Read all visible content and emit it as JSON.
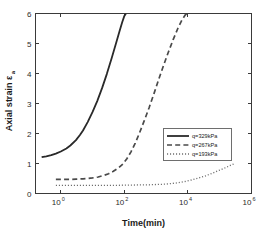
{
  "chart_data": {
    "type": "line",
    "title": "",
    "xlabel": "Time(min)",
    "ylabel": "Axial strain",
    "ylabel_sub": "a",
    "ylabel_symbol": "ε",
    "xscale": "log",
    "yscale": "linear",
    "xlim": [
      0.16,
      1000000
    ],
    "ylim": [
      0,
      6
    ],
    "grid": false,
    "legend_position": "center-right",
    "xticks": [
      {
        "value": 1,
        "label": "10",
        "exponent": "0"
      },
      {
        "value": 100,
        "label": "10",
        "exponent": "2"
      },
      {
        "value": 10000,
        "label": "10",
        "exponent": "4"
      },
      {
        "value": 1000000,
        "label": "10",
        "exponent": "6"
      }
    ],
    "yticks": [
      {
        "value": 0,
        "label": "0"
      },
      {
        "value": 1,
        "label": "1"
      },
      {
        "value": 2,
        "label": "2"
      },
      {
        "value": 3,
        "label": "3"
      },
      {
        "value": 4,
        "label": "4"
      },
      {
        "value": 5,
        "label": "5"
      },
      {
        "value": 6,
        "label": "6"
      }
    ],
    "series": [
      {
        "name": "q=329kPa",
        "style": "solid",
        "color": "#2a2a2a",
        "width": 1.8,
        "points": [
          [
            0.25,
            1.21
          ],
          [
            0.35,
            1.24
          ],
          [
            0.5,
            1.28
          ],
          [
            0.7,
            1.33
          ],
          [
            1.0,
            1.4
          ],
          [
            1.5,
            1.5
          ],
          [
            2.0,
            1.6
          ],
          [
            3.0,
            1.78
          ],
          [
            4.0,
            1.95
          ],
          [
            5.0,
            2.1
          ],
          [
            7.0,
            2.38
          ],
          [
            10.0,
            2.72
          ],
          [
            14.0,
            3.08
          ],
          [
            20.0,
            3.52
          ],
          [
            28.0,
            3.98
          ],
          [
            40.0,
            4.52
          ],
          [
            55.0,
            5.02
          ],
          [
            70.0,
            5.4
          ],
          [
            85.0,
            5.7
          ],
          [
            100.0,
            5.92
          ],
          [
            112.0,
            6.0
          ]
        ]
      },
      {
        "name": "q=267kPa",
        "style": "dashed",
        "color": "#4a4a4a",
        "width": 1.7,
        "points": [
          [
            0.7,
            0.47
          ],
          [
            1.0,
            0.47
          ],
          [
            1.5,
            0.47
          ],
          [
            2.0,
            0.47
          ],
          [
            3.0,
            0.48
          ],
          [
            5.0,
            0.49
          ],
          [
            7.0,
            0.5
          ],
          [
            10.0,
            0.52
          ],
          [
            15.0,
            0.55
          ],
          [
            22.0,
            0.6
          ],
          [
            32.0,
            0.66
          ],
          [
            45.0,
            0.74
          ],
          [
            65.0,
            0.85
          ],
          [
            90.0,
            0.98
          ],
          [
            120.0,
            1.16
          ],
          [
            160.0,
            1.38
          ],
          [
            220.0,
            1.68
          ],
          [
            300.0,
            2.02
          ],
          [
            420.0,
            2.42
          ],
          [
            600.0,
            2.86
          ],
          [
            850.0,
            3.32
          ],
          [
            1200.0,
            3.8
          ],
          [
            1700.0,
            4.26
          ],
          [
            2400.0,
            4.7
          ],
          [
            3400.0,
            5.12
          ],
          [
            4800.0,
            5.5
          ],
          [
            6600.0,
            5.8
          ],
          [
            8200.0,
            5.95
          ],
          [
            9300.0,
            6.0
          ]
        ]
      },
      {
        "name": "q=193kPa",
        "style": "dotted",
        "color": "#6e6e6e",
        "width": 1.3,
        "points": [
          [
            0.7,
            0.27
          ],
          [
            1.0,
            0.27
          ],
          [
            2.0,
            0.27
          ],
          [
            5.0,
            0.27
          ],
          [
            10.0,
            0.27
          ],
          [
            20.0,
            0.27
          ],
          [
            40.0,
            0.27
          ],
          [
            80.0,
            0.275
          ],
          [
            150.0,
            0.28
          ],
          [
            300.0,
            0.285
          ],
          [
            600.0,
            0.29
          ],
          [
            1000.0,
            0.3
          ],
          [
            1800.0,
            0.31
          ],
          [
            3000.0,
            0.33
          ],
          [
            5000.0,
            0.36
          ],
          [
            8000.0,
            0.4
          ],
          [
            13000.0,
            0.45
          ],
          [
            22000.0,
            0.52
          ],
          [
            36000.0,
            0.59
          ],
          [
            60000.0,
            0.68
          ],
          [
            100000.0,
            0.78
          ],
          [
            160000.0,
            0.87
          ],
          [
            230000.0,
            0.95
          ],
          [
            300000.0,
            1.0
          ]
        ]
      }
    ]
  },
  "legend": {
    "entries": [
      {
        "label": "q=329kPa"
      },
      {
        "label": "q=267kPa"
      },
      {
        "label": "q=193kPa"
      }
    ]
  }
}
